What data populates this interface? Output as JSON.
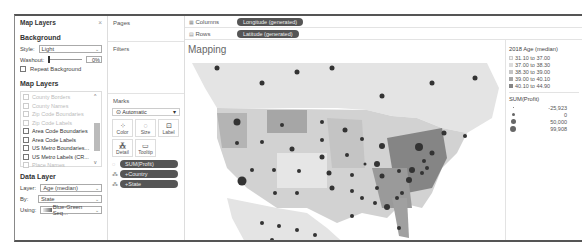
{
  "map_layers_panel": {
    "title": "Map Layers",
    "close_glyph": "×",
    "background": {
      "heading": "Background",
      "style_label": "Style:",
      "style_value": "Light",
      "washout_label": "Washout:",
      "washout_value": "0%",
      "repeat_label": "Repeat Background"
    },
    "layers": {
      "heading": "Map Layers",
      "items": [
        {
          "label": "County Borders",
          "enabled": false
        },
        {
          "label": "County Names",
          "enabled": false
        },
        {
          "label": "Zip Code Boundaries",
          "enabled": false
        },
        {
          "label": "Zip Code Labels",
          "enabled": false
        },
        {
          "label": "Area Code Boundaries",
          "enabled": true
        },
        {
          "label": "Area Code Labels",
          "enabled": true
        },
        {
          "label": "US Metro Boundaries...",
          "enabled": true
        },
        {
          "label": "US Metro Labels (CR...",
          "enabled": true
        },
        {
          "label": "Place Names",
          "enabled": false
        }
      ]
    },
    "data_layer": {
      "heading": "Data Layer",
      "layer_label": "Layer:",
      "layer_value": "Age (median)",
      "by_label": "By:",
      "by_value": "State",
      "using_label": "Using:",
      "using_value": "Blue-Green Seq..."
    }
  },
  "cards": {
    "pages_title": "Pages",
    "filters_title": "Filters",
    "marks": {
      "title": "Marks",
      "type": "Automatic",
      "buttons": [
        {
          "label": "Color",
          "icon": "color-icon"
        },
        {
          "label": "Size",
          "icon": "size-icon"
        },
        {
          "label": "Label",
          "icon": "label-icon"
        },
        {
          "label": "Detail",
          "icon": "detail-icon"
        },
        {
          "label": "Tooltip",
          "icon": "tooltip-icon"
        }
      ],
      "fields": [
        {
          "label": "SUM(Profit)",
          "icon": "size-icon"
        },
        {
          "label": "Country",
          "icon": "detail-icon"
        },
        {
          "label": "State",
          "icon": "detail-icon"
        }
      ]
    }
  },
  "shelves": {
    "columns_label": "Columns",
    "columns_value": "Longitude (generated)",
    "rows_label": "Rows",
    "rows_value": "Latitude (generated)"
  },
  "view": {
    "title": "Mapping"
  },
  "legend": {
    "color_title": "2018 Age (median)",
    "color_items": [
      {
        "label": "31.10 to 37.00",
        "color": "#f2f2f2"
      },
      {
        "label": "37.00 to 38.30",
        "color": "#dcdcdc"
      },
      {
        "label": "38.30 to 39.00",
        "color": "#c4c4c4"
      },
      {
        "label": "39.00 to 40.10",
        "color": "#a6a6a6"
      },
      {
        "label": "40.10 to 44.90",
        "color": "#858585"
      }
    ],
    "size_title": "SUM(Profit)",
    "size_items": [
      {
        "label": "-25,923",
        "size": 1
      },
      {
        "label": "0",
        "size": 3
      },
      {
        "label": "50,000",
        "size": 5
      },
      {
        "label": "99,908",
        "size": 6
      }
    ]
  }
}
